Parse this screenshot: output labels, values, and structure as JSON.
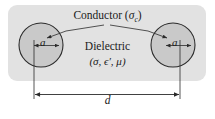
{
  "figure": {
    "labels": {
      "conductor": "Conductor (",
      "conductor_symbol": "σ",
      "conductor_subscript": "c",
      "conductor_close": ")",
      "dielectric": "Dielectric",
      "dielectric_params": "(σ, ϵ′, μ)",
      "radius_left": "a",
      "radius_right": "a",
      "distance": "d"
    },
    "colors": {
      "panel_fill": "#e2e2e2",
      "conductor_fill": "#c9c9c9",
      "stroke": "#2b2b2b",
      "page_background": "#ffffff",
      "text": "#1a1a1a"
    },
    "geometry": {
      "panel": {
        "x": 8,
        "y": 5,
        "width": 198,
        "height": 76,
        "radius": 9
      },
      "left_conductor": {
        "cx": 41,
        "cy": 45,
        "r": 22
      },
      "right_conductor": {
        "cx": 173,
        "cy": 45,
        "r": 22
      },
      "dimension_line_y": 94,
      "separation_label": "d",
      "radius_label": "a"
    }
  }
}
